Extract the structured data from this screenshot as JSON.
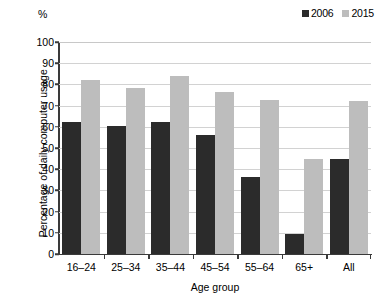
{
  "chart_data": {
    "type": "bar",
    "title": "",
    "subtitle": "",
    "unit_label": "%",
    "xlabel": "Age group",
    "ylabel": "Percentage of daily computer usage",
    "ylim": [
      0,
      100
    ],
    "ytick_step": 10,
    "yticks": [
      100,
      90,
      80,
      70,
      60,
      50,
      40,
      30,
      20,
      10,
      0
    ],
    "grid": true,
    "legend_position": "top-right",
    "categories": [
      "16–24",
      "25–34",
      "35–44",
      "45–54",
      "55–64",
      "65+",
      "All"
    ],
    "series": [
      {
        "name": "2006",
        "color": "#2b2b2b",
        "values": [
          62.5,
          60.5,
          62.5,
          56,
          36.5,
          9.5,
          45
        ]
      },
      {
        "name": "2015",
        "color": "#bdbdbd",
        "values": [
          82,
          78.5,
          84,
          76.5,
          72.5,
          45,
          72
        ]
      }
    ]
  }
}
